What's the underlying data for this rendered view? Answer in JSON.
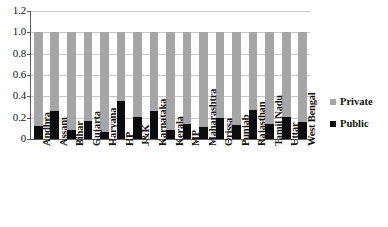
{
  "chart_data": {
    "type": "bar",
    "subtype": "stacked-bar-100-percent",
    "title": "",
    "subtitle": "",
    "xlabel": "",
    "ylabel": "",
    "ylim": [
      0,
      1.2
    ],
    "yticks": [
      0,
      0.2,
      0.4,
      0.6,
      0.8,
      1.0,
      1.2
    ],
    "ytick_labels": [
      "0",
      "0.2",
      "0.4",
      "0.6",
      "0.8",
      "1.0",
      "1.2"
    ],
    "grid": true,
    "grid_axis": "y",
    "legend_position": "right",
    "categories": [
      "Andhra",
      "Assam",
      "Bihar",
      "Gujarta",
      "Haryana",
      "HP",
      "J&K",
      "Karnataka",
      "Kerala",
      "MP",
      "Maharashtra",
      "Orissa",
      "Punjab",
      "Rajasthan",
      "Tamil Nadu",
      "Uttar",
      "West Bengal"
    ],
    "series": [
      {
        "name": "Public",
        "color": "#0d0d0d",
        "values": [
          0.12,
          0.26,
          0.08,
          0.17,
          0.07,
          0.36,
          0.21,
          0.26,
          0.08,
          0.14,
          0.11,
          0.2,
          0.13,
          0.27,
          0.14,
          0.21,
          0.16
        ]
      },
      {
        "name": "Private",
        "color": "#a6a6a6",
        "values": [
          0.88,
          0.74,
          0.92,
          0.83,
          0.93,
          0.64,
          0.79,
          0.74,
          0.92,
          0.86,
          0.89,
          0.8,
          0.87,
          0.73,
          0.86,
          0.79,
          0.84
        ]
      }
    ],
    "totals": [
      1.0,
      1.0,
      1.0,
      1.0,
      1.0,
      1.0,
      1.0,
      1.0,
      1.0,
      1.0,
      1.0,
      1.0,
      1.0,
      1.0,
      1.0,
      1.0,
      1.0
    ]
  },
  "legend": {
    "items": [
      {
        "label": "Private",
        "color": "#a6a6a6"
      },
      {
        "label": "Public",
        "color": "#0d0d0d"
      }
    ]
  },
  "colors": {
    "private": "#a6a6a6",
    "public": "#0d0d0d",
    "grid": "#c8c8c8",
    "axis": "#5a5a5a",
    "background": "#ffffff"
  }
}
